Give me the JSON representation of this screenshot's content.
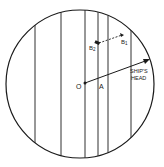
{
  "diagram": {
    "type": "compass-rose-deviation",
    "circle": {
      "cx": 80,
      "cy": 84,
      "r": 74
    },
    "meridian_lines_x": [
      35,
      61,
      85,
      98,
      108,
      131
    ],
    "labels": {
      "origin": "O",
      "point_a": "A",
      "b1": "B",
      "b1_sub": "1",
      "b2": "B",
      "b2_sub": "2",
      "ships_head_line1": "SHIP'S",
      "ships_head_line2": "HEAD"
    },
    "colors": {
      "stroke": "#1a1a1a",
      "background": "#ffffff"
    }
  }
}
